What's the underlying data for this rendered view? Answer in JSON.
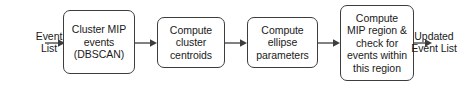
{
  "diagram": {
    "orientation": "left-to-right",
    "background_color": "#ffffff",
    "stroke_color": "#3d3d3d",
    "text_color": "#1a1a1a",
    "labels": {
      "input": "Event\nList",
      "output": "Updated\nEvent List"
    },
    "nodes": [
      {
        "id": "cluster-mip-events",
        "text": "Cluster MIP\nevents\n(DBSCAN)",
        "shape": "rounded-rect"
      },
      {
        "id": "compute-cluster-centroids",
        "text": "Compute\ncluster\ncentroids",
        "shape": "rounded-rect"
      },
      {
        "id": "compute-ellipse-parameters",
        "text": "Compute\nellipse\nparameters",
        "shape": "rounded-rect"
      },
      {
        "id": "compute-mip-region",
        "text": "Compute\nMIP region &\ncheck for\nevents within\nthis region",
        "shape": "rounded-rect"
      }
    ],
    "edges": [
      {
        "id": "edge-input-to-cluster",
        "from": "Event List",
        "to": "Cluster MIP events (DBSCAN)"
      },
      {
        "id": "edge-cluster-to-centroids",
        "from": "Cluster MIP events (DBSCAN)",
        "to": "Compute cluster centroids"
      },
      {
        "id": "edge-centroids-to-ellipse",
        "from": "Compute cluster centroids",
        "to": "Compute ellipse parameters"
      },
      {
        "id": "edge-ellipse-to-region",
        "from": "Compute ellipse parameters",
        "to": "Compute MIP region & check for events within this region"
      },
      {
        "id": "edge-region-to-output",
        "from": "Compute MIP region & check for events within this region",
        "to": "Updated Event List"
      }
    ]
  }
}
